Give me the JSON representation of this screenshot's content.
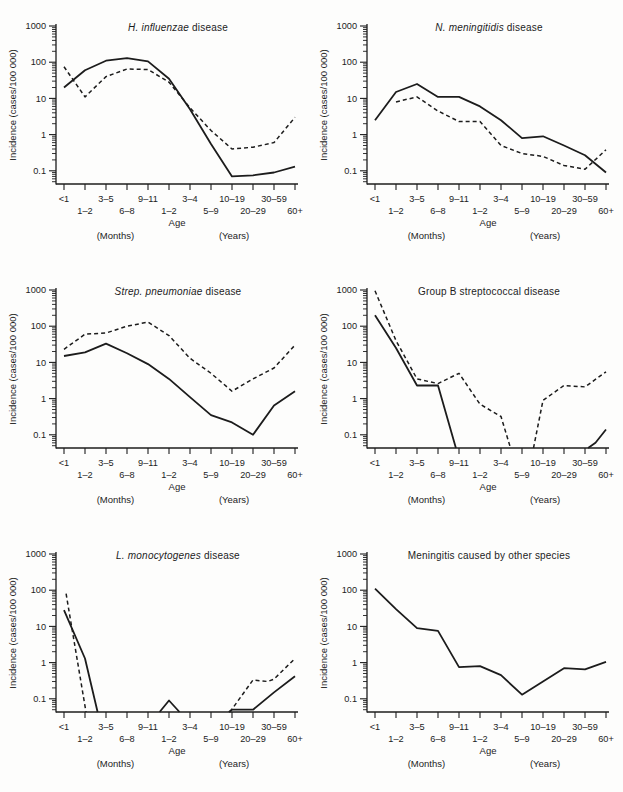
{
  "colors": {
    "ink": "#1c1c1c",
    "paper": "#fdfdfc"
  },
  "chart_data": {
    "type": "line",
    "y_scale": "log",
    "ylim": [
      0.04,
      1000
    ],
    "y_ticks": [
      "1000",
      "100",
      "10",
      "1",
      "0.1"
    ],
    "ylabel": "Incidence (cases/100 000)",
    "xlabel": "Age",
    "categories": [
      "<1",
      "1–2",
      "3–5",
      "6–8",
      "9–11",
      "1–2",
      "3–4",
      "5–9",
      "10–19",
      "20–29",
      "30–59",
      "60+"
    ],
    "x_unit_labels": {
      "months": "(Months)",
      "years": "(Years)"
    },
    "grid": false,
    "legend": "none",
    "x_index_note": "x = category index 0–11; fractional x marks where a line meets the axis floor (value below axis minimum)",
    "charts": [
      {
        "title_italic": "H. influenzae",
        "title_rest": " disease",
        "series": [
          {
            "name": "solid-line",
            "style": "solid",
            "segments": [
              [
                [
                  0,
                  20
                ],
                [
                  1,
                  60
                ],
                [
                  2,
                  110
                ],
                [
                  3,
                  130
                ],
                [
                  4,
                  105
                ],
                [
                  5,
                  35
                ],
                [
                  6,
                  5
                ],
                [
                  7,
                  0.55
                ],
                [
                  8,
                  0.07
                ],
                [
                  9,
                  0.075
                ],
                [
                  10,
                  0.09
                ],
                [
                  11,
                  0.13
                ]
              ]
            ]
          },
          {
            "name": "dashed-line",
            "style": "dashed",
            "segments": [
              [
                [
                  0,
                  75
                ],
                [
                  1,
                  11
                ],
                [
                  2,
                  40
                ],
                [
                  3,
                  65
                ],
                [
                  4,
                  63
                ],
                [
                  5,
                  28
                ],
                [
                  6,
                  5.5
                ],
                [
                  7,
                  1.3
                ],
                [
                  8,
                  0.4
                ],
                [
                  9,
                  0.45
                ],
                [
                  10,
                  0.6
                ],
                [
                  11,
                  3
                ]
              ]
            ]
          }
        ]
      },
      {
        "title_italic": "N. meningitidis",
        "title_rest": " disease",
        "series": [
          {
            "name": "solid-line",
            "style": "solid",
            "segments": [
              [
                [
                  0,
                  2.5
                ],
                [
                  1,
                  15
                ],
                [
                  2,
                  25
                ],
                [
                  3,
                  11
                ],
                [
                  4,
                  11
                ],
                [
                  5,
                  6
                ],
                [
                  6,
                  2.5
                ],
                [
                  7,
                  0.8
                ],
                [
                  8,
                  0.9
                ],
                [
                  9,
                  0.5
                ],
                [
                  10,
                  0.27
                ],
                [
                  11,
                  0.09
                ]
              ]
            ]
          },
          {
            "name": "dashed-line",
            "style": "dashed",
            "segments": [
              [
                [
                  1,
                  8
                ],
                [
                  2,
                  11
                ],
                [
                  3,
                  4.5
                ],
                [
                  4,
                  2.3
                ],
                [
                  5,
                  2.3
                ],
                [
                  6,
                  0.5
                ],
                [
                  7,
                  0.3
                ],
                [
                  8,
                  0.25
                ],
                [
                  9,
                  0.14
                ],
                [
                  10,
                  0.11
                ],
                [
                  11,
                  0.38
                ]
              ]
            ]
          }
        ]
      },
      {
        "title_italic": "Strep. pneumoniae",
        "title_rest": " disease",
        "series": [
          {
            "name": "solid-line",
            "style": "solid",
            "segments": [
              [
                [
                  0,
                  15
                ],
                [
                  1,
                  19
                ],
                [
                  2,
                  33
                ],
                [
                  3,
                  18
                ],
                [
                  4,
                  9
                ],
                [
                  5,
                  3.5
                ],
                [
                  6,
                  1.1
                ],
                [
                  7,
                  0.35
                ],
                [
                  8,
                  0.22
                ],
                [
                  9,
                  0.1
                ],
                [
                  10,
                  0.65
                ],
                [
                  11,
                  1.6
                ]
              ]
            ]
          },
          {
            "name": "dashed-line",
            "style": "dashed",
            "segments": [
              [
                [
                  0,
                  23
                ],
                [
                  1,
                  60
                ],
                [
                  2,
                  65
                ],
                [
                  3,
                  100
                ],
                [
                  4,
                  130
                ],
                [
                  5,
                  55
                ],
                [
                  6,
                  13
                ],
                [
                  7,
                  5
                ],
                [
                  8,
                  1.6
                ],
                [
                  9,
                  3.5
                ],
                [
                  10,
                  7
                ],
                [
                  11,
                  30
                ]
              ]
            ]
          }
        ]
      },
      {
        "title_italic": "",
        "title_rest": "Group B streptococcal disease",
        "series": [
          {
            "name": "solid-line",
            "style": "solid",
            "segments": [
              [
                [
                  0,
                  200
                ],
                [
                  1,
                  25
                ],
                [
                  2,
                  2.3
                ],
                [
                  3,
                  2.3
                ],
                [
                  3.85,
                  0.04
                ]
              ],
              [
                [
                  10.15,
                  0.04
                ],
                [
                  10.5,
                  0.06
                ],
                [
                  11,
                  0.14
                ]
              ]
            ]
          },
          {
            "name": "dashed-line",
            "style": "dashed",
            "segments": [
              [
                [
                  0,
                  950
                ],
                [
                  1,
                  40
                ],
                [
                  2,
                  3.5
                ],
                [
                  3,
                  2.6
                ],
                [
                  4,
                  5
                ],
                [
                  5,
                  0.7
                ],
                [
                  6,
                  0.32
                ],
                [
                  6.45,
                  0.04
                ]
              ],
              [
                [
                  7.55,
                  0.04
                ],
                [
                  8,
                  0.9
                ],
                [
                  9,
                  2.3
                ],
                [
                  10,
                  2.1
                ],
                [
                  11,
                  5.5
                ]
              ]
            ]
          }
        ]
      },
      {
        "title_italic": "L. monocytogenes",
        "title_rest": " disease",
        "series": [
          {
            "name": "solid-line",
            "style": "solid",
            "segments": [
              [
                [
                  0,
                  28
                ],
                [
                  1,
                  1.3
                ],
                [
                  1.6,
                  0.04
                ]
              ],
              [
                [
                  4.55,
                  0.04
                ],
                [
                  5,
                  0.09
                ],
                [
                  5.5,
                  0.04
                ]
              ],
              [
                [
                  7.85,
                  0.04
                ],
                [
                  8,
                  0.05
                ],
                [
                  9,
                  0.05
                ],
                [
                  10,
                  0.15
                ],
                [
                  11,
                  0.42
                ]
              ]
            ]
          },
          {
            "name": "dashed-line",
            "style": "dashed",
            "segments": [
              [
                [
                  0.1,
                  80
                ],
                [
                  1.05,
                  0.04
                ]
              ],
              [
                [
                  7.9,
                  0.04
                ],
                [
                  9,
                  0.33
                ],
                [
                  9.7,
                  0.3
                ],
                [
                  10,
                  0.35
                ],
                [
                  11,
                  1.3
                ]
              ]
            ]
          }
        ]
      },
      {
        "title_italic": "",
        "title_rest": "Meningitis caused by other species",
        "series": [
          {
            "name": "solid-line",
            "style": "solid",
            "segments": [
              [
                [
                  0,
                  110
                ],
                [
                  1,
                  30
                ],
                [
                  2,
                  9
                ],
                [
                  3,
                  7.5
                ],
                [
                  4,
                  0.75
                ],
                [
                  5,
                  0.8
                ],
                [
                  6,
                  0.45
                ],
                [
                  7,
                  0.13
                ],
                [
                  8,
                  0.3
                ],
                [
                  9,
                  0.7
                ],
                [
                  10,
                  0.65
                ],
                [
                  11,
                  1.05
                ]
              ]
            ]
          }
        ]
      }
    ]
  }
}
